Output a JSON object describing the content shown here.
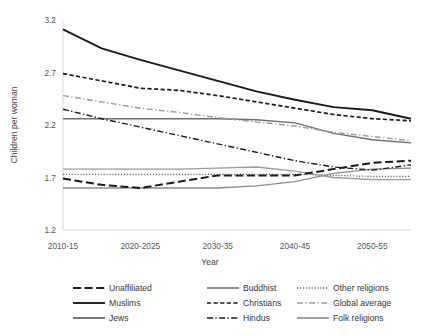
{
  "chart_data": {
    "type": "line",
    "title": "",
    "xlabel": "Year",
    "ylabel": "Children per woman",
    "grid": false,
    "legend_position": "bottom",
    "x": [
      "2010-15",
      "2015-20",
      "2020-2025",
      "2025-30",
      "2030-35",
      "2035-40",
      "2040-45",
      "2045-50",
      "2050-55",
      "2055-60"
    ],
    "xticks": [
      "2010-15",
      "2020-2025",
      "2030-35",
      "2040-45",
      "2050-55"
    ],
    "xtick_index": [
      0,
      2,
      4,
      6,
      8
    ],
    "yticks": [
      1.2,
      1.7,
      2.2,
      2.7,
      3.2
    ],
    "ytick_labels": [
      "1.2",
      "1.7",
      "2.2",
      "2.7",
      "3.2"
    ],
    "ylim": [
      1.2,
      3.2
    ],
    "series": [
      {
        "name": "Muslims",
        "style": "solid",
        "color": "#1a1a1a",
        "width": 1.9,
        "values": [
          3.11,
          2.93,
          2.82,
          2.72,
          2.62,
          2.52,
          2.44,
          2.37,
          2.34,
          2.26
        ]
      },
      {
        "name": "Christians",
        "style": "dashed",
        "color": "#1a1a1a",
        "width": 1.7,
        "values": [
          2.69,
          2.62,
          2.55,
          2.53,
          2.48,
          2.42,
          2.36,
          2.3,
          2.26,
          2.24
        ]
      },
      {
        "name": "Hindus",
        "style": "dashdot",
        "color": "#1a1a1a",
        "width": 1.4,
        "values": [
          2.35,
          2.26,
          2.18,
          2.1,
          2.02,
          1.94,
          1.86,
          1.8,
          1.77,
          1.82
        ]
      },
      {
        "name": "Global average",
        "style": "dashdot-light",
        "color": "#9a9a9a",
        "width": 1.4,
        "values": [
          2.48,
          2.42,
          2.36,
          2.32,
          2.27,
          2.23,
          2.19,
          2.13,
          2.09,
          2.05
        ]
      },
      {
        "name": "Jews",
        "style": "solid",
        "color": "#6e6e6e",
        "width": 1.4,
        "values": [
          2.26,
          2.26,
          2.26,
          2.26,
          2.26,
          2.25,
          2.22,
          2.12,
          2.06,
          2.03
        ]
      },
      {
        "name": "Unaffiliated",
        "style": "longdash",
        "color": "#1a1a1a",
        "width": 2.0,
        "values": [
          1.69,
          1.63,
          1.6,
          1.66,
          1.72,
          1.72,
          1.72,
          1.78,
          1.84,
          1.86
        ]
      },
      {
        "name": "Buddhist",
        "style": "solid",
        "color": "#8c8c8c",
        "width": 1.3,
        "values": [
          1.6,
          1.6,
          1.6,
          1.6,
          1.6,
          1.62,
          1.66,
          1.74,
          1.78,
          1.79
        ]
      },
      {
        "name": "Folk religions",
        "style": "solid",
        "color": "#9a9a9a",
        "width": 1.3,
        "values": [
          1.78,
          1.78,
          1.78,
          1.78,
          1.79,
          1.8,
          1.76,
          1.7,
          1.68,
          1.68
        ]
      },
      {
        "name": "Other religions",
        "style": "dotted",
        "color": "#555555",
        "width": 1.2,
        "values": [
          1.73,
          1.73,
          1.73,
          1.73,
          1.73,
          1.73,
          1.73,
          1.72,
          1.71,
          1.71
        ]
      }
    ]
  },
  "legend": {
    "columns": [
      [
        {
          "label": "Unaffiliated",
          "style": "longdash",
          "color": "#1a1a1a"
        },
        {
          "label": "Muslims",
          "style": "solid",
          "color": "#1a1a1a"
        },
        {
          "label": "Jews",
          "style": "solid",
          "color": "#6e6e6e"
        }
      ],
      [
        {
          "label": "Buddhist",
          "style": "solid",
          "color": "#8c8c8c"
        },
        {
          "label": "Christians",
          "style": "dashed",
          "color": "#1a1a1a"
        },
        {
          "label": "Hindus",
          "style": "dashdot",
          "color": "#1a1a1a"
        }
      ],
      [
        {
          "label": "Other religions",
          "style": "dotted",
          "color": "#555555"
        },
        {
          "label": "Global average",
          "style": "dashdot-light",
          "color": "#9a9a9a"
        },
        {
          "label": "Folk religions",
          "style": "solid",
          "color": "#9a9a9a"
        }
      ]
    ]
  }
}
